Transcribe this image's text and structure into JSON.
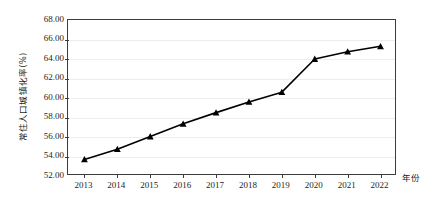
{
  "chart_data": {
    "type": "line",
    "title": "",
    "xlabel": "年份",
    "ylabel": "常住人口城镇化率(%)",
    "categories": [
      "2013",
      "2014",
      "2015",
      "2016",
      "2017",
      "2018",
      "2019",
      "2020",
      "2021",
      "2022"
    ],
    "x": [
      2013,
      2014,
      2015,
      2016,
      2017,
      2018,
      2019,
      2020,
      2021,
      2022
    ],
    "values": [
      53.7,
      54.75,
      56.05,
      57.35,
      58.5,
      59.6,
      60.6,
      64.0,
      64.75,
      65.3
    ],
    "series": [
      {
        "name": "常住人口城镇化率(%)",
        "values": [
          53.7,
          54.75,
          56.05,
          57.35,
          58.5,
          59.6,
          60.6,
          64.0,
          64.75,
          65.3
        ]
      }
    ],
    "ylim": [
      52.0,
      68.0
    ],
    "ytick_step": 2.0,
    "ytick_labels": [
      "52.00",
      "54.00",
      "56.00",
      "58.00",
      "60.00",
      "62.00",
      "64.00",
      "66.00",
      "68.00"
    ],
    "ytick_values": [
      52.0,
      54.0,
      56.0,
      58.0,
      60.0,
      62.0,
      64.0,
      66.0,
      68.0
    ],
    "grid": true,
    "grid_axis": "y",
    "legend": false,
    "legend_position": "none",
    "marker": "triangle",
    "marker_color": "#000000",
    "line_color": "#000000",
    "annotations": []
  },
  "colors": {
    "line": "#000000",
    "marker": "#000000",
    "grid": "#ededed",
    "axis": "#3c3c3c",
    "text": "#231f20",
    "background": "#ffffff"
  }
}
